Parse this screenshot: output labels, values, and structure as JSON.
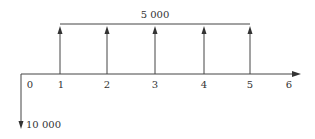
{
  "diagram": {
    "type": "cash-flow",
    "axis": {
      "periods": [
        "0",
        "1",
        "2",
        "3",
        "4",
        "5",
        "6"
      ]
    },
    "inflows": {
      "label": "5 000",
      "periods": [
        1,
        2,
        3,
        4,
        5
      ]
    },
    "outflow": {
      "label": "10 000",
      "period": 0
    }
  },
  "colors": {
    "line": "#444444",
    "text": "#333333",
    "background": "#ffffff"
  }
}
